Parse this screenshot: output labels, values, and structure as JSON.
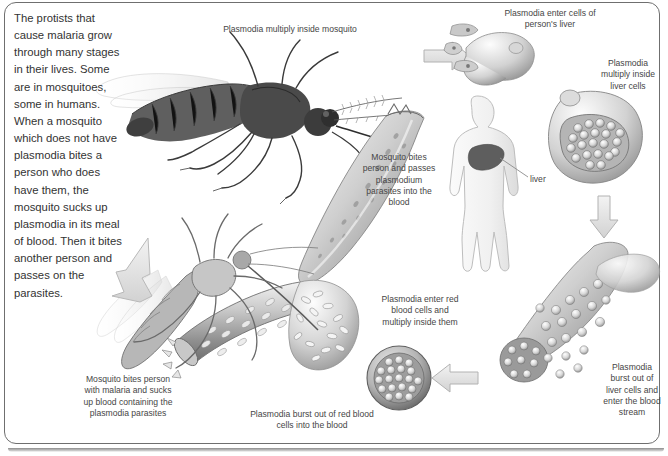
{
  "diagram": {
    "background_color": "#ffffff",
    "ink_color": "#3b3b3b",
    "frame_color": "#6f6f6f",
    "intro_text": "The protists that cause malaria grow through many stages in their lives. Some are in mosquitoes, some in humans. When a mosquito which does not have plasmodia bites a person who does have them, the mosquito sucks up plasmodia in its meal of blood. Then it bites another person and passes on the parasites.",
    "labels": {
      "multiply_in_mosquito": "Plasmodia multiply inside mosquito",
      "enter_liver_cells": "Plasmodia enter cells of\nperson's liver",
      "multiply_liver_cells": "Plasmodia\nmultiply inside\nliver cells",
      "mosquito_bites_person": "Mosquito bites\nperson and passes\nplasmodium\nparasites into the\nblood",
      "liver": "liver",
      "burst_liver_cells": "Plasmodia\nburst out of\nliver cells and\nenter the blood\nstream",
      "enter_red_blood_cells": "Plasmodia enter red\nblood cells and\nmultiply inside them",
      "burst_red_blood_cells": "Plasmodia burst out of red blood\ncells into the blood",
      "mosquito_bites_malaria_person": "Mosquito bites person\nwith malaria and sucks\nup blood containing the\nplasmodia parasites"
    },
    "figures": [
      {
        "name": "mosquito-infected",
        "description": "Adult mosquito feeding, top left"
      },
      {
        "name": "sporozoite-large",
        "description": "Large curved plasmodium sporozoite"
      },
      {
        "name": "liver-cell-entry",
        "description": "Liver cell with plasmodia entering"
      },
      {
        "name": "human-body-silhouette",
        "description": "Human outline with liver shaded"
      },
      {
        "name": "liver-cell-full",
        "description": "Liver cell packed with plasmodia"
      },
      {
        "name": "sporozoite-bursting",
        "description": "Plasmodia bursting from liver cell into blood"
      },
      {
        "name": "red-blood-cell-infected",
        "description": "Red blood cell filled with merozoites"
      },
      {
        "name": "blood-vessel-burst",
        "description": "Blood vessel with plasmodia bursting out"
      },
      {
        "name": "mosquito-biting",
        "description": "Mosquito feeding on blood vessel, bottom left"
      }
    ],
    "arrows": [
      {
        "name": "arrow-to-liver",
        "direction": "right"
      },
      {
        "name": "arrow-liver-down",
        "direction": "down"
      },
      {
        "name": "arrow-to-red-blood-cell",
        "direction": "left"
      },
      {
        "name": "arrow-to-mosquito",
        "direction": "up-left"
      }
    ]
  }
}
